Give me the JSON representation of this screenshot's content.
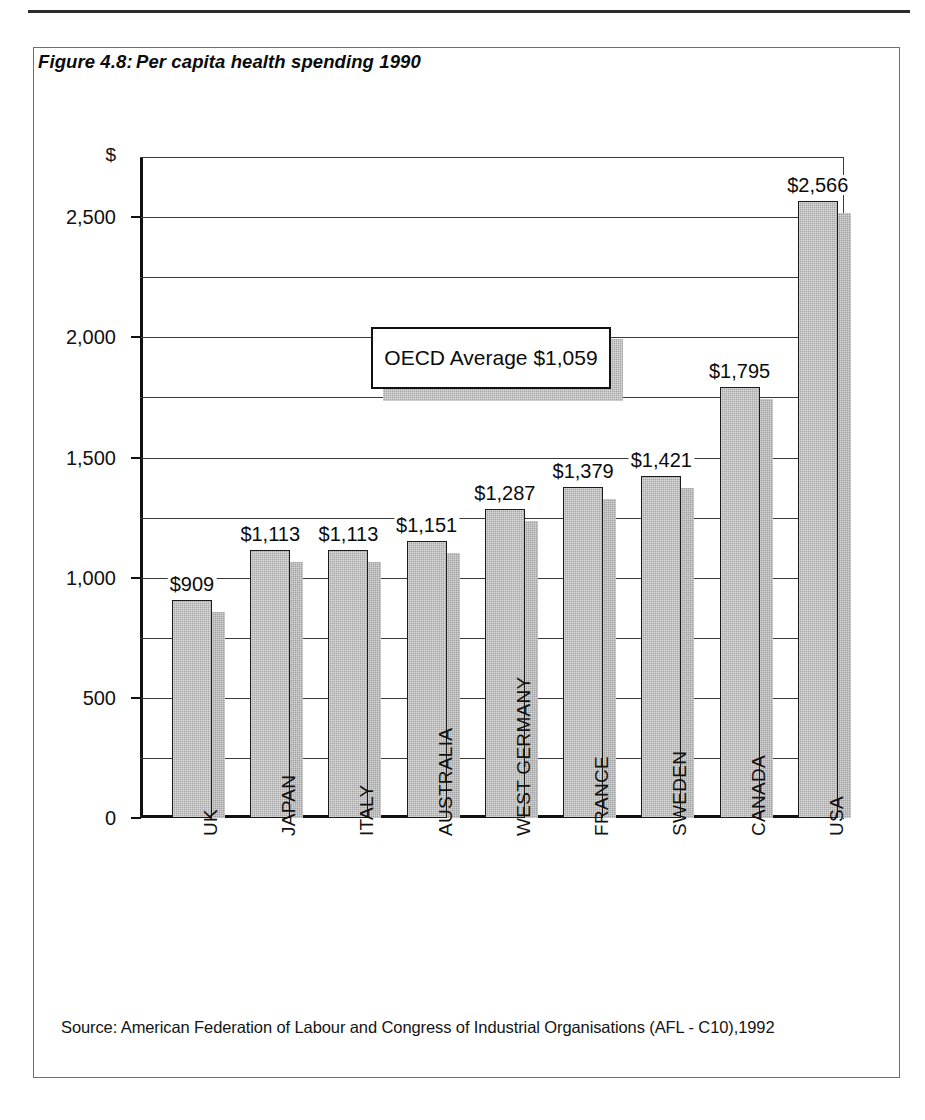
{
  "figure": {
    "caption_number": "Figure 4.8:",
    "caption_text": "Per capita health spending 1990",
    "source_note": "Source: American Federation of Labour and Congress of Industrial Organisations (AFL - C10),1992"
  },
  "annotation": {
    "oecd_average_label": "OECD Average $1,059",
    "oecd_average_value": 1059
  },
  "chart_data": {
    "type": "bar",
    "title": "Per capita health spending 1990",
    "xlabel": "",
    "ylabel": "$",
    "categories": [
      "UK",
      "JAPAN",
      "ITALY",
      "AUSTRALIA",
      "WEST GERMANY",
      "FRANCE",
      "SWEDEN",
      "CANADA",
      "USA"
    ],
    "values": [
      909,
      1113,
      1113,
      1151,
      1287,
      1379,
      1421,
      1795,
      2566
    ],
    "value_labels": [
      "$909",
      "$1,113",
      "$1,113",
      "$1,151",
      "$1,287",
      "$1,379",
      "$1,421",
      "$1,795",
      "$2,566"
    ],
    "ylim": [
      0,
      2750
    ],
    "ytick_values": [
      0,
      500,
      1000,
      1500,
      2000,
      2500
    ],
    "ytick_labels": [
      "0",
      "500",
      "1,000",
      "1,500",
      "2,000",
      "2,500"
    ],
    "gridline_values": [
      250,
      500,
      750,
      1000,
      1250,
      1500,
      1750,
      2000,
      2250,
      2500,
      2750
    ],
    "grid": true,
    "legend": "none",
    "annotations": [
      {
        "text": "OECD Average $1,059",
        "value": 1059
      }
    ],
    "colors": {
      "bar_fill": "#a8a8a8",
      "bar_outline": "#1a1a1a",
      "bar_shadow": "#a2a2a2",
      "axis": "#111111",
      "grid": "#3a3a3a",
      "text": "#0b0b0b",
      "page_background": "#ffffff"
    }
  }
}
